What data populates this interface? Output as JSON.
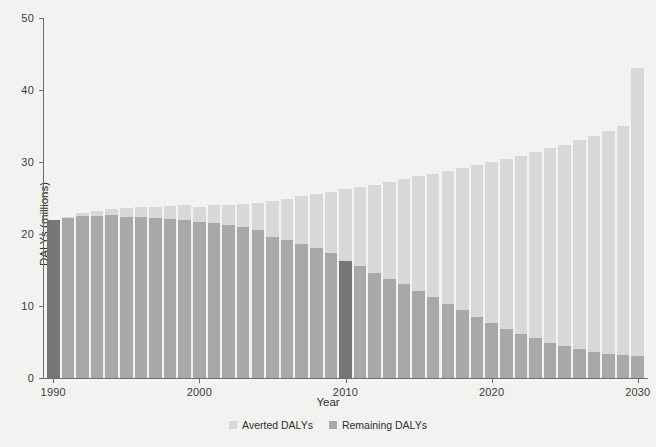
{
  "chart_data": {
    "type": "bar",
    "title": "",
    "subtitle": "",
    "xlabel": "Year",
    "ylabel": "DALYs (millions)",
    "stacked": true,
    "grid": false,
    "legend_position": "bottom",
    "xlim": [
      1989.3,
      2030.7
    ],
    "ylim": [
      0,
      50
    ],
    "yticks": [
      0,
      10,
      20,
      30,
      40,
      50
    ],
    "ytick_labels": [
      "0",
      "10",
      "20",
      "30",
      "40",
      "50"
    ],
    "xticks": [
      1990,
      2000,
      2010,
      2020,
      2030
    ],
    "xtick_labels": [
      "1990",
      "2000",
      "2010",
      "2020",
      "2030"
    ],
    "categories": [
      1990,
      1991,
      1992,
      1993,
      1994,
      1995,
      1996,
      1997,
      1998,
      1999,
      2000,
      2001,
      2002,
      2003,
      2004,
      2005,
      2006,
      2007,
      2008,
      2009,
      2010,
      2011,
      2012,
      2013,
      2014,
      2015,
      2016,
      2017,
      2018,
      2019,
      2020,
      2021,
      2022,
      2023,
      2024,
      2025,
      2026,
      2027,
      2028,
      2029,
      2030
    ],
    "series": [
      {
        "name": "Remaining DALYs",
        "color": "#a8a8a8",
        "values": [
          22.0,
          22.2,
          22.5,
          22.5,
          22.6,
          22.4,
          22.4,
          22.2,
          22.1,
          21.9,
          21.6,
          21.5,
          21.2,
          21.0,
          20.6,
          19.6,
          19.1,
          18.6,
          18.1,
          17.3,
          16.3,
          15.5,
          14.6,
          13.8,
          13.0,
          12.1,
          11.2,
          10.3,
          9.4,
          8.5,
          7.6,
          6.8,
          6.1,
          5.5,
          4.9,
          4.4,
          4.0,
          3.6,
          3.4,
          3.2,
          3.1
        ]
      },
      {
        "name": "Averted DALYs",
        "color": "#d8d8d8",
        "values": [
          0.0,
          0.2,
          0.4,
          0.7,
          0.9,
          1.2,
          1.3,
          1.6,
          1.8,
          2.1,
          2.2,
          2.5,
          2.8,
          3.1,
          3.7,
          5.0,
          5.8,
          6.7,
          7.5,
          8.6,
          9.9,
          11.0,
          12.2,
          13.4,
          14.6,
          15.9,
          17.2,
          18.5,
          19.8,
          21.1,
          22.4,
          23.6,
          24.8,
          25.9,
          27.0,
          28.0,
          29.0,
          30.0,
          30.9,
          31.8,
          39.9
        ]
      }
    ],
    "totals": [
      22.0,
      22.4,
      22.9,
      23.2,
      23.5,
      23.6,
      23.7,
      23.8,
      23.9,
      24.0,
      23.8,
      24.0,
      24.0,
      24.1,
      24.3,
      24.6,
      24.9,
      25.3,
      25.6,
      25.9,
      26.2,
      26.5,
      26.8,
      27.2,
      27.6,
      28.0,
      28.4,
      28.8,
      29.2,
      29.6,
      30.0,
      30.4,
      30.9,
      31.4,
      31.9,
      32.4,
      33.0,
      33.6,
      34.3,
      35.0,
      43.0
    ],
    "highlighted_years": [
      1990,
      2010
    ],
    "highlight_color": "#777777",
    "legend": [
      {
        "label": "Averted DALYs",
        "color": "#d8d8d8"
      },
      {
        "label": "Remaining DALYs",
        "color": "#a8a8a8"
      }
    ],
    "background_color": "#f2f2f0",
    "axis_color": "#6d6d6d"
  }
}
